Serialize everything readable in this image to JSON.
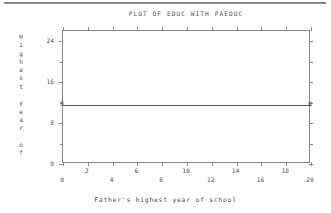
{
  "page": {
    "top_rule": "horizontal-rule"
  },
  "chart_data": {
    "type": "scatter",
    "title": "PLOT OF EDUC WITH PAEDUC",
    "xlabel": "Father's highest year of school",
    "ylabel": "Highest year of",
    "ylabel_letters": [
      "H",
      "i",
      "g",
      "h",
      "e",
      "s",
      "t",
      "",
      "y",
      "e",
      "a",
      "r",
      "",
      "o",
      "f"
    ],
    "xlim": [
      0,
      20
    ],
    "ylim": [
      0,
      26
    ],
    "grid": false,
    "legend": null,
    "x_ticks_major": [
      0,
      4,
      8,
      12,
      16,
      20
    ],
    "x_ticks_minor": [
      2,
      6,
      10,
      14,
      18
    ],
    "x_tick_labels_lower": [
      "0",
      "4",
      "8",
      "12",
      "16",
      "20"
    ],
    "x_tick_labels_upper": [
      "2",
      "6",
      "10",
      "14",
      "18"
    ],
    "y_ticks_major": [
      0,
      8,
      16,
      24
    ],
    "y_tick_labels": [
      "0",
      "8",
      "16",
      "24"
    ],
    "y_ticks_minor": [
      4,
      12,
      20
    ],
    "series": [
      {
        "name": "regression-line",
        "marker": "R",
        "x": [
          0,
          20
        ],
        "y": [
          11.5,
          11.5
        ],
        "endpoint_labels": [
          "R",
          "R"
        ]
      }
    ],
    "annotations": [
      {
        "text": "R",
        "x": 0,
        "y": 11.5,
        "name": "r-marker-left"
      },
      {
        "text": "R",
        "x": 20,
        "y": 11.5,
        "name": "r-marker-right"
      }
    ],
    "colors": {
      "line": "#5a5a5a",
      "axis": "#868686",
      "text": "#4f4f4f",
      "background": "#ffffff"
    }
  }
}
